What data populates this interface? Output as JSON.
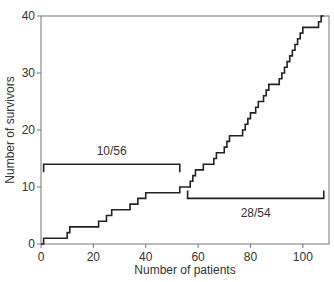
{
  "chart_data": {
    "type": "line",
    "step": true,
    "title": "",
    "xlabel": "Number of patients",
    "ylabel": "Number of survivors",
    "xlim": [
      0,
      110
    ],
    "ylim": [
      0,
      40
    ],
    "xticks": [
      0,
      20,
      40,
      60,
      80,
      100
    ],
    "yticks": [
      0,
      10,
      20,
      30,
      40
    ],
    "grid": false,
    "legend": null,
    "series": [
      {
        "name": "Cumulative survivors",
        "x": [
          0,
          1,
          10,
          11,
          22,
          25,
          27,
          34,
          37,
          40,
          53,
          56,
          57,
          58,
          59,
          62,
          66,
          67,
          70,
          71,
          72,
          77,
          78,
          79,
          80,
          82,
          83,
          84,
          85,
          86,
          87,
          91,
          92,
          93,
          94,
          95,
          96,
          97,
          98,
          99,
          100,
          101,
          102,
          105,
          106,
          107,
          108
        ],
        "y": [
          0,
          1,
          2,
          3,
          4,
          5,
          6,
          7,
          8,
          9,
          10,
          10,
          11,
          12,
          13,
          14,
          15,
          16,
          17,
          18,
          19,
          20,
          21,
          22,
          23,
          24,
          25,
          25,
          26,
          27,
          28,
          29,
          30,
          31,
          32,
          33,
          34,
          35,
          36,
          37,
          38,
          38,
          38,
          38,
          39,
          40,
          40
        ]
      }
    ],
    "annotations": [
      {
        "type": "bracket",
        "label": "10/56",
        "x_start": 1,
        "x_end": 53,
        "y": 14,
        "label_position": "above"
      },
      {
        "type": "bracket",
        "label": "28/54",
        "x_start": 56,
        "x_end": 108,
        "y": 8,
        "label_position": "below"
      }
    ]
  },
  "axes": {
    "xlabel": "Number of patients",
    "ylabel": "Number of survivors",
    "xtick_labels": [
      "0",
      "20",
      "40",
      "60",
      "80",
      "100"
    ],
    "ytick_labels": [
      "0",
      "10",
      "20",
      "30",
      "40"
    ]
  },
  "annotations": {
    "first_label": "10/56",
    "second_label": "28/54"
  },
  "colors": {
    "line": "#222222",
    "axis": "#555555",
    "text": "#333333"
  }
}
